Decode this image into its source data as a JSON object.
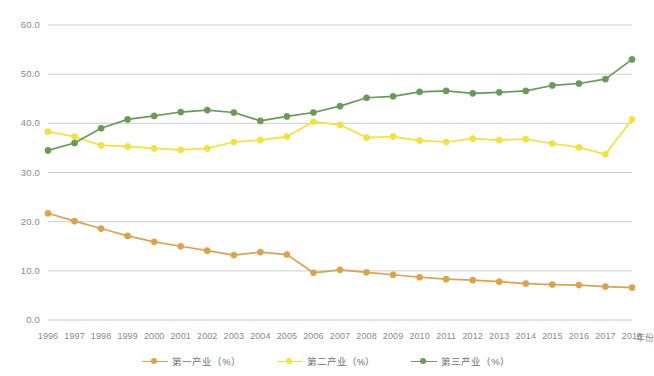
{
  "chart_data": {
    "type": "line",
    "title": "",
    "subtitle": "",
    "xlabel": "年份",
    "ylabel": "",
    "xlim": [
      1996,
      2018
    ],
    "ylim": [
      0.0,
      60.0
    ],
    "grid": true,
    "legend_position": "bottom",
    "y_ticks": [
      "0.0",
      "10.0",
      "20.0",
      "30.0",
      "40.0",
      "50.0",
      "60.0"
    ],
    "y_tick_values": [
      0.0,
      10.0,
      20.0,
      30.0,
      40.0,
      50.0,
      60.0
    ],
    "categories": [
      "1996",
      "1997",
      "1998",
      "1999",
      "2000",
      "2001",
      "2002",
      "2003",
      "2004",
      "2005",
      "2006",
      "2007",
      "2008",
      "2009",
      "2010",
      "2011",
      "2012",
      "2013",
      "2014",
      "2015",
      "2016",
      "2017",
      "2018"
    ],
    "series": [
      {
        "name": "第一产业（%）",
        "color": "#dda34a",
        "values": [
          21.7,
          20.1,
          18.6,
          17.1,
          15.9,
          15.0,
          14.1,
          13.2,
          13.8,
          13.3,
          9.6,
          10.2,
          9.7,
          9.2,
          8.7,
          8.3,
          8.1,
          7.8,
          7.4,
          7.2,
          7.1,
          6.8,
          6.6
        ]
      },
      {
        "name": "第二产业（%）",
        "color": "#f2e33c",
        "values": [
          38.3,
          37.3,
          35.5,
          35.3,
          34.9,
          34.6,
          34.9,
          36.2,
          36.6,
          37.3,
          40.3,
          39.7,
          37.1,
          37.3,
          36.5,
          36.2,
          36.9,
          36.6,
          36.8,
          35.9,
          35.1,
          33.7,
          40.8
        ]
      },
      {
        "name": "第三产业（%）",
        "color": "#6a9a57",
        "values": [
          34.5,
          36.0,
          39.0,
          40.8,
          41.5,
          42.3,
          42.7,
          42.2,
          40.5,
          41.4,
          42.2,
          43.5,
          45.2,
          45.5,
          46.4,
          46.6,
          46.1,
          46.3,
          46.6,
          47.7,
          48.1,
          49.0,
          53.0
        ]
      }
    ],
    "axis": {
      "gridline_color": "#c8c8c8",
      "tick_label_color": "#8a8a8a"
    }
  }
}
